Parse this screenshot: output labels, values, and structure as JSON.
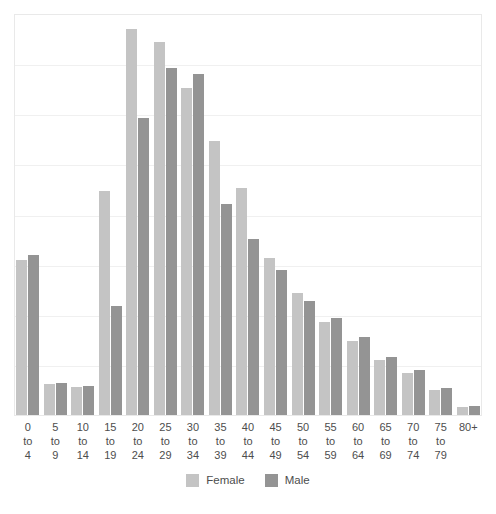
{
  "chart_data": {
    "type": "bar",
    "title": "",
    "subtitle": "",
    "xlabel": "",
    "ylabel": "",
    "grid": true,
    "legend_position": "bottom-center",
    "ylim": [
      0,
      8
    ],
    "gridline_count": 7,
    "categories": [
      "0\nto\n4",
      "5\nto\n9",
      "10\nto\n14",
      "15\nto\n19",
      "20\nto\n24",
      "25\nto\n29",
      "30\nto\n34",
      "35\nto\n39",
      "40\nto\n44",
      "45\nto\n49",
      "50\nto\n54",
      "55\nto\n59",
      "60\nto\n64",
      "65\nto\n69",
      "70\nto\n74",
      "75\nto\n79",
      "80+"
    ],
    "series": [
      {
        "name": "Female",
        "color": "#c4c4c4",
        "values": [
          3.1,
          0.62,
          0.56,
          4.46,
          7.7,
          7.45,
          6.53,
          5.46,
          4.53,
          3.13,
          2.43,
          1.85,
          1.47,
          1.09,
          0.84,
          0.5,
          0.16
        ]
      },
      {
        "name": "Male",
        "color": "#949494",
        "values": [
          3.2,
          0.64,
          0.57,
          2.18,
          5.93,
          6.93,
          6.8,
          4.21,
          3.52,
          2.89,
          2.28,
          1.93,
          1.55,
          1.16,
          0.9,
          0.54,
          0.17
        ]
      }
    ]
  },
  "legend": {
    "items": [
      {
        "label": "Female",
        "color": "#c4c4c4"
      },
      {
        "label": "Male",
        "color": "#949494"
      }
    ]
  },
  "colors": {
    "female": "#c4c4c4",
    "male": "#949494",
    "grid": "#f0f0f0",
    "frame": "#e9e9e9",
    "text": "#4d4d4d",
    "background": "#ffffff"
  }
}
